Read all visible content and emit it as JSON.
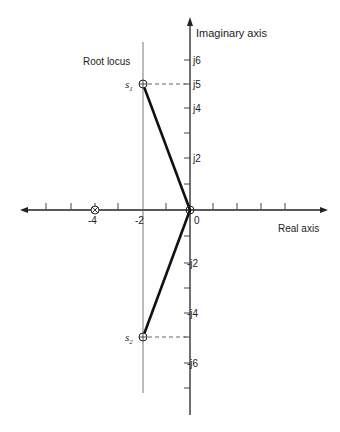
{
  "labels": {
    "imaginary_axis": "Imaginary axis",
    "real_axis": "Real axis",
    "root_locus": "Root locus",
    "s1": "s",
    "s1_sub": "1",
    "s2": "s",
    "s2_sub": "2",
    "origin": "0"
  },
  "real_ticks": [
    {
      "value": -4,
      "label": "-4"
    },
    {
      "value": -2,
      "label": "-2"
    }
  ],
  "imag_ticks_pos": [
    {
      "value": 2,
      "label": "j2"
    },
    {
      "value": 4,
      "label": "j4"
    },
    {
      "value": 5,
      "label": "j5"
    },
    {
      "value": 6,
      "label": "j6"
    }
  ],
  "imag_ticks_neg": [
    {
      "value": -2,
      "label": "-j2"
    },
    {
      "value": -4,
      "label": "-j4"
    },
    {
      "value": -6,
      "label": "-j6"
    }
  ],
  "poles": [
    {
      "name": "s1",
      "re": -2,
      "im": 5
    },
    {
      "name": "s2",
      "re": -2,
      "im": -5
    }
  ],
  "zeros_marker": [
    {
      "re": -4,
      "im": 0
    },
    {
      "re": 0,
      "im": 0
    }
  ],
  "colors": {
    "axis": "#222222",
    "locus": "#111111",
    "dashed": "#555555"
  }
}
